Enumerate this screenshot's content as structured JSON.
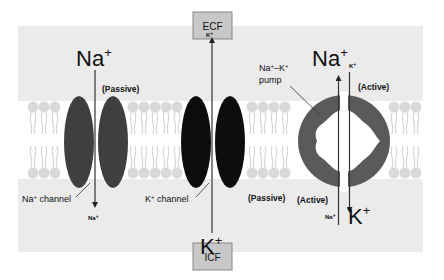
{
  "compartments": {
    "top": {
      "label": "ECF",
      "box_fill": "#c8c8c8"
    },
    "bottom": {
      "label": "ICF",
      "box_fill": "#c8c8c8"
    }
  },
  "colors": {
    "fluid_bg": "#ebebeb",
    "membrane_bg": "#ffffff",
    "lipid_head": "#d9d9d9",
    "na_channel": "#3f3f3f",
    "k_channel": "#0d0d0d",
    "pump": "#5a5a5a",
    "line": "#333333"
  },
  "na_channel": {
    "label_prefix": "Na",
    "label_suffix": " channel",
    "mode": "(Passive)",
    "ion_top": {
      "base": "Na",
      "sup": "+"
    },
    "ion_bottom": {
      "base": "Na",
      "sup": "+"
    },
    "direction": "ECF to ICF"
  },
  "k_channel": {
    "label_prefix": "K",
    "label_suffix": " channel",
    "mode": "(Passive)",
    "ion_top": {
      "base": "K",
      "sup": "+"
    },
    "ion_bottom": {
      "base": "K",
      "sup": "+"
    },
    "direction": "ICF to ECF"
  },
  "pump": {
    "label_line1_a": "Na",
    "label_line1_b": "–K",
    "label_line2": "pump",
    "mode_top": "(Active)",
    "mode_bottom": "(Active)",
    "ion_top_large": {
      "base": "Na",
      "sup": "+"
    },
    "ion_top_small": {
      "base": "K",
      "sup": "+"
    },
    "ion_bottom_small": {
      "base": "Na",
      "sup": "+"
    },
    "ion_bottom_large": {
      "base": "K",
      "sup": "+"
    }
  },
  "sup_plus": "+"
}
